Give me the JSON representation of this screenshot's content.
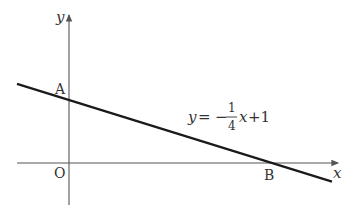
{
  "diagram": {
    "axes": {
      "x_label": "x",
      "y_label": "y",
      "origin_label": "O"
    },
    "line": {
      "equation": {
        "lhs": "y",
        "equals": "=",
        "sign": "−",
        "numerator": "1",
        "denominator": "4",
        "var": "x",
        "tail": "+1"
      },
      "slope": -0.25,
      "intercept": 1
    },
    "points": {
      "A": {
        "label": "A",
        "x": 0,
        "y": 1
      },
      "B": {
        "label": "B",
        "x": 4,
        "y": 0
      }
    },
    "colors": {
      "axis": "#555555",
      "line": "#1a1a1a",
      "text": "#333333"
    }
  }
}
